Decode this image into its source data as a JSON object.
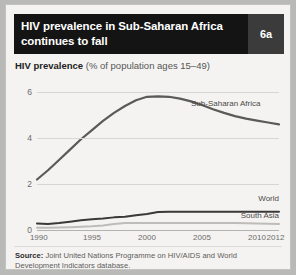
{
  "header": {
    "title_line1": "HIV prevalence in Sub-Saharan Africa",
    "title_line2": "continues to fall",
    "badge": "6a",
    "bg_color": "#141414",
    "badge_bg_color": "#3b3b3b"
  },
  "subtitle": {
    "strong": "HIV prevalence",
    "rest": " (% of population ages 15–49)"
  },
  "source": {
    "label": "Source:",
    "text": " Joint United Nations Programme on HIV/AIDS and World Development Indicators database."
  },
  "chart_data": {
    "type": "line",
    "title": "HIV prevalence in Sub-Saharan Africa continues to fall",
    "subtitle": "HIV prevalence (% of population ages 15–49)",
    "xlabel": "",
    "ylabel": "",
    "xlim": [
      1990,
      2012
    ],
    "ylim": [
      0,
      6.4
    ],
    "yticks": [
      0,
      2,
      4,
      6
    ],
    "ytick_labels": [
      "0",
      "2",
      "4",
      "6"
    ],
    "xticks": [
      1990,
      1995,
      2000,
      2005,
      2010,
      2012
    ],
    "xtick_labels": [
      "1990",
      "1995",
      "2000",
      "2005",
      "2010",
      "2012"
    ],
    "grid": true,
    "legend_position": "inline-right",
    "x": [
      1990,
      1991,
      1992,
      1993,
      1994,
      1995,
      1996,
      1997,
      1998,
      1999,
      2000,
      2001,
      2002,
      2003,
      2004,
      2005,
      2006,
      2007,
      2008,
      2009,
      2010,
      2011,
      2012
    ],
    "series": [
      {
        "name": "Sub-Saharan Africa",
        "color": "#5b5a58",
        "width": 2.2,
        "values": [
          2.2,
          2.6,
          3.05,
          3.5,
          3.95,
          4.35,
          4.75,
          5.1,
          5.4,
          5.65,
          5.8,
          5.82,
          5.8,
          5.72,
          5.6,
          5.44,
          5.26,
          5.1,
          4.96,
          4.85,
          4.76,
          4.68,
          4.6
        ],
        "label_x": 2004,
        "label_y": 5.5
      },
      {
        "name": "World",
        "color": "#3a3937",
        "width": 2.0,
        "values": [
          0.28,
          0.26,
          0.3,
          0.36,
          0.42,
          0.47,
          0.5,
          0.55,
          0.58,
          0.64,
          0.7,
          0.78,
          0.8,
          0.8,
          0.8,
          0.8,
          0.8,
          0.8,
          0.8,
          0.8,
          0.8,
          0.8,
          0.8
        ],
        "label_x": 2012,
        "label_y": 1.35
      },
      {
        "name": "South Asia",
        "color": "#bdbcb9",
        "width": 2.0,
        "values": [
          0.1,
          0.1,
          0.11,
          0.12,
          0.14,
          0.16,
          0.2,
          0.26,
          0.3,
          0.3,
          0.3,
          0.3,
          0.3,
          0.3,
          0.3,
          0.3,
          0.3,
          0.3,
          0.3,
          0.29,
          0.28,
          0.27,
          0.26
        ],
        "label_x": 2012,
        "label_y": 0.62
      }
    ]
  }
}
